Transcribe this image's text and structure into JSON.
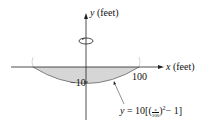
{
  "figure": {
    "y_axis_label_var": "y",
    "y_axis_label_unit": "(feet)",
    "x_axis_label_var": "x",
    "x_axis_label_unit": "(feet)",
    "x_tick_label": "100",
    "y_tick_label": "−10",
    "equation": {
      "lhs": "y",
      "eq": "= 10[(",
      "frac_num": "x",
      "frac_den": "100",
      "after": ")",
      "exp": "2",
      "tail": "− 1]"
    },
    "colors": {
      "shade": "#d6d6d6",
      "line": "#222222"
    },
    "rotation_indicator": "rotation-about-y-axis"
  }
}
